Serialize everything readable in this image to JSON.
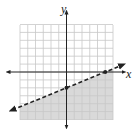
{
  "chart_data": {
    "type": "line",
    "title": "",
    "xlabel": "x",
    "ylabel": "y",
    "xlim": [
      -6,
      6
    ],
    "ylim": [
      -6,
      6
    ],
    "grid": true,
    "grid_step": 1,
    "series": [
      {
        "name": "boundary",
        "style": "dashed",
        "equation": "y = (2/5)x - 2",
        "slope": 0.4,
        "intercept": -2,
        "points": [
          [
            -6,
            -4.4
          ],
          [
            0,
            -2
          ],
          [
            5,
            0
          ],
          [
            6,
            0.4
          ]
        ]
      }
    ],
    "marked_points": [
      [
        0,
        -2
      ],
      [
        5,
        0
      ]
    ],
    "shaded_region": "below the dashed line",
    "inequality": "y < (2/5)x - 2"
  },
  "labels": {
    "x_axis": "x",
    "y_axis": "y"
  },
  "colors": {
    "grid": "#c8c8c8",
    "shade": "#d9d9d9",
    "axis": "#222222",
    "line": "#222222"
  }
}
